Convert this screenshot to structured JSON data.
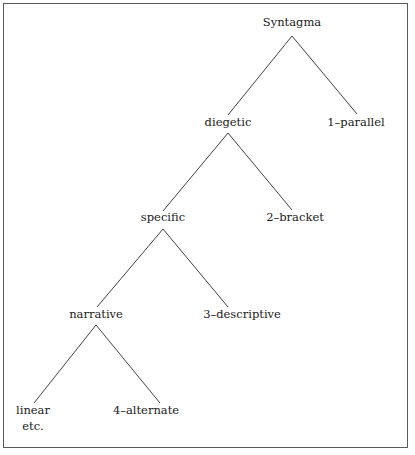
{
  "figure": {
    "type": "tree-diagram",
    "background_color": "#ffffff",
    "border_color": "#5a5a5a",
    "line_color": "#2b2b2b",
    "text_color": "#1a1a1a"
  },
  "nodes": {
    "root": {
      "label": "Syntagma",
      "x": 292,
      "y": 26
    },
    "diegetic": {
      "label": "diegetic",
      "x": 228,
      "y": 126
    },
    "parallel": {
      "label": "1–parallel",
      "x": 356,
      "y": 126
    },
    "specific": {
      "label": "specific",
      "x": 163,
      "y": 221
    },
    "bracket": {
      "label": "2–bracket",
      "x": 295,
      "y": 221
    },
    "narrative": {
      "label": "narrative",
      "x": 96,
      "y": 318
    },
    "descriptive": {
      "label": "3–descriptive",
      "x": 242,
      "y": 318
    },
    "linear": {
      "label": "linear",
      "x": 33,
      "y": 414
    },
    "linear_second": {
      "label": "etc.",
      "x": 33,
      "y": 430
    },
    "alternate": {
      "label": "4–alternate",
      "x": 146,
      "y": 414
    }
  },
  "edges": [
    {
      "from": "root",
      "to": "diegetic",
      "path": "M292,36 L228,115"
    },
    {
      "from": "root",
      "to": "parallel",
      "path": "M292,36 L357,114"
    },
    {
      "from": "diegetic",
      "to": "specific",
      "path": "M228,133 L163,211"
    },
    {
      "from": "diegetic",
      "to": "bracket",
      "path": "M228,133 L292,210"
    },
    {
      "from": "specific",
      "to": "narrative",
      "path": "M163,229 L97,307"
    },
    {
      "from": "specific",
      "to": "descriptive",
      "path": "M163,229 L228,307"
    },
    {
      "from": "narrative",
      "to": "linear",
      "path": "M96,325 L34,403"
    },
    {
      "from": "narrative",
      "to": "alternate",
      "path": "M96,325 L160,403"
    }
  ],
  "chart_data": {
    "type": "tree",
    "title": "Syntagma",
    "root": "Syntagma",
    "hierarchy": [
      {
        "label": "Syntagma",
        "level": 0,
        "children": [
          "diegetic",
          "1–parallel"
        ]
      },
      {
        "label": "diegetic",
        "level": 1,
        "children": [
          "specific",
          "2–bracket"
        ]
      },
      {
        "label": "1–parallel",
        "level": 1,
        "children": []
      },
      {
        "label": "specific",
        "level": 2,
        "children": [
          "narrative",
          "3–descriptive"
        ]
      },
      {
        "label": "2–bracket",
        "level": 2,
        "children": []
      },
      {
        "label": "narrative",
        "level": 3,
        "children": [
          "linear etc.",
          "4–alternate"
        ]
      },
      {
        "label": "3–descriptive",
        "level": 3,
        "children": []
      },
      {
        "label": "linear etc.",
        "level": 4,
        "children": []
      },
      {
        "label": "4–alternate",
        "level": 4,
        "children": []
      }
    ],
    "leaf_order": [
      "linear etc.",
      "4–alternate",
      "3–descriptive",
      "2–bracket",
      "1–parallel"
    ],
    "numbered_leaves": [
      "1–parallel",
      "2–bracket",
      "3–descriptive",
      "4–alternate"
    ],
    "depth": 5,
    "orientation": "top-down-right-skewed",
    "grid": false,
    "legend": false
  }
}
